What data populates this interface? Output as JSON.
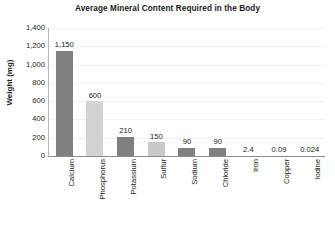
{
  "chart_data": {
    "type": "bar",
    "title": "Average Mineral Content Required in the Body",
    "xlabel": "",
    "ylabel": "Weight (mg)",
    "ylim": [
      0,
      1400
    ],
    "grid": true,
    "legend": "none",
    "categories": [
      "Calcium",
      "Phosphorus",
      "Potassium",
      "Sulfur",
      "Sodium",
      "Chloride",
      "Iron",
      "Copper",
      "Iodine"
    ],
    "values": [
      1150,
      600,
      210,
      150,
      90,
      90,
      2.4,
      0.09,
      0.024
    ],
    "value_labels": [
      "1,150",
      "600",
      "210",
      "150",
      "90",
      "90",
      "2.4",
      "0.09",
      "0.024"
    ],
    "bar_colors": [
      "#808080",
      "#d3d3d3",
      "#808080",
      "#c9c9c9",
      "#808080",
      "#808080",
      "#808080",
      "#808080",
      "#808080"
    ],
    "y_ticks": [
      0,
      200,
      400,
      600,
      800,
      1000,
      1200,
      1400
    ],
    "y_tick_labels": [
      "0",
      "200",
      "400",
      "600",
      "800",
      "1,000",
      "1,200",
      "1,400"
    ]
  },
  "colors": {
    "dark_bar": "#808080",
    "light_bar": "#d3d3d3",
    "axis": "#8c8c8c",
    "grid": "#f1f1f1",
    "text": "#222222"
  }
}
